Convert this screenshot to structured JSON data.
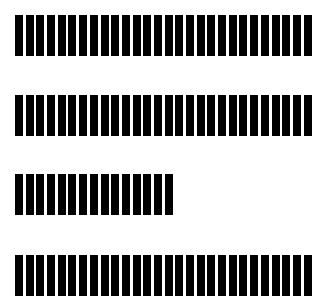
{
  "figure": {
    "bar_color": "#000000",
    "background_color": "#ffffff",
    "rows": [
      {
        "name": "line-1",
        "top": 15,
        "bar_count": 28
      },
      {
        "name": "line-2",
        "top": 95,
        "bar_count": 28
      },
      {
        "name": "line-3",
        "top": 174,
        "bar_count": 15
      },
      {
        "name": "line-4",
        "top": 255,
        "bar_count": 28
      }
    ]
  }
}
